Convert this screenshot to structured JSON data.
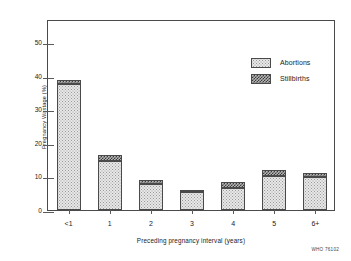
{
  "chart_data": {
    "type": "bar",
    "title": "",
    "subtitle": "",
    "xlabel": "Preceding pregnancy interval (years)",
    "ylabel": "Pregnancy Wastage (%)",
    "categories": [
      "<1",
      "1",
      "2",
      "3",
      "4",
      "5",
      "6+"
    ],
    "series": [
      {
        "name": "Abortions",
        "values": [
          37.6,
          14.5,
          7.7,
          5.4,
          6.7,
          10.2,
          9.9
        ]
      },
      {
        "name": "Stillbirths",
        "values": [
          1.2,
          1.9,
          1.4,
          0.7,
          1.6,
          1.7,
          1.0
        ]
      }
    ],
    "totals": [
      38.8,
      16.4,
      9.1,
      6.1,
      8.3,
      11.9,
      10.9
    ],
    "stacked": true,
    "ylim": [
      0,
      57
    ],
    "yticks": [
      0,
      10,
      20,
      30,
      40,
      50
    ],
    "ytick_labels": [
      "0",
      "10",
      "20",
      "30",
      "40",
      "50"
    ],
    "grid": false,
    "legend_position": "top-right"
  },
  "legend": {
    "items": [
      {
        "label": "Abortions",
        "pattern": "light-stipple"
      },
      {
        "label": "Stillbirths",
        "pattern": "dark-checker"
      }
    ]
  },
  "credit": "WHO 76102"
}
